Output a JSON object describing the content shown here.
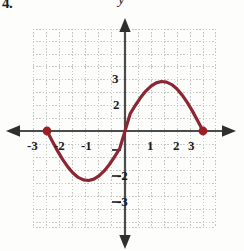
{
  "figure": {
    "exercise_number": "4.",
    "axis_label_y": "y",
    "axis_label_x": "x",
    "colors": {
      "curve": "#8B2733",
      "point": "#A81F27",
      "axis": "#4a4a4a",
      "grid": "#c9c9c9",
      "text": "#1b1b1b"
    }
  },
  "chart_data": {
    "type": "line",
    "title": "",
    "xlabel": "x",
    "ylabel": "y",
    "xlim": [
      -3.5,
      3.5
    ],
    "ylim": [
      -4.2,
      4.2
    ],
    "grid": true,
    "legend": "none",
    "x_ticks": [
      -3,
      -2,
      -1,
      1,
      2,
      3
    ],
    "x_tick_labels": [
      "-3",
      "-2",
      "-1",
      "1",
      "2",
      "3"
    ],
    "y_ticks": [
      -3,
      -2,
      -1,
      1,
      2,
      3
    ],
    "y_tick_labels": [
      "-3",
      "-2",
      "-1",
      "1",
      "2",
      "3"
    ],
    "series": [
      {
        "name": "f(x)",
        "x": [
          -3.0,
          -2.8,
          -2.6,
          -2.4,
          -2.2,
          -2.0,
          -1.8,
          -1.6,
          -1.4,
          -1.2,
          -1.0,
          -0.8,
          -0.6,
          -0.4,
          -0.2,
          0.0,
          0.2,
          0.4,
          0.6,
          0.8,
          1.0,
          1.2,
          1.4,
          1.6,
          1.8,
          2.0,
          2.2,
          2.4,
          2.6,
          2.8,
          3.0
        ],
        "y": [
          0.0,
          -0.77,
          -1.51,
          -2.18,
          -2.76,
          -3.23,
          -3.57,
          -3.76,
          -3.81,
          -3.7,
          -3.45,
          -3.07,
          -2.57,
          -1.98,
          -1.33,
          0.0,
          1.33,
          1.98,
          2.57,
          3.07,
          3.45,
          3.7,
          3.81,
          3.76,
          3.57,
          3.23,
          2.76,
          2.18,
          1.51,
          0.77,
          0.0
        ]
      }
    ],
    "points": [
      {
        "x": -3,
        "y": 0,
        "marker": "filled-circle"
      },
      {
        "x": 3,
        "y": 0,
        "marker": "filled-circle"
      }
    ],
    "annotations": []
  }
}
